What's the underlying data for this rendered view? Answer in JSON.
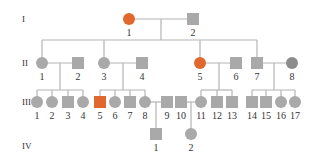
{
  "colors": {
    "affected": "#e0682e",
    "unaffected": "#a9a9a9",
    "dark": "#8c8c8c",
    "line": "#b4b4b4"
  },
  "generations": [
    {
      "label": "I",
      "y": 19
    },
    {
      "label": "II",
      "y": 63
    },
    {
      "label": "III",
      "y": 102
    },
    {
      "label": "IV",
      "y": 146
    }
  ],
  "individuals": [
    {
      "id": "I-1",
      "gen": "I",
      "num": "1",
      "sex": "female",
      "status": "affected",
      "x": 129,
      "y": 19
    },
    {
      "id": "I-2",
      "gen": "I",
      "num": "2",
      "sex": "male",
      "status": "unaffected",
      "x": 193,
      "y": 19
    },
    {
      "id": "II-1",
      "gen": "II",
      "num": "1",
      "sex": "female",
      "status": "unaffected",
      "x": 42,
      "y": 63
    },
    {
      "id": "II-2",
      "gen": "II",
      "num": "2",
      "sex": "male",
      "status": "unaffected",
      "x": 78,
      "y": 63
    },
    {
      "id": "II-3",
      "gen": "II",
      "num": "3",
      "sex": "female",
      "status": "unaffected",
      "x": 104,
      "y": 63
    },
    {
      "id": "II-4",
      "gen": "II",
      "num": "4",
      "sex": "male",
      "status": "unaffected",
      "x": 142,
      "y": 63
    },
    {
      "id": "II-5",
      "gen": "II",
      "num": "5",
      "sex": "female",
      "status": "affected",
      "x": 200,
      "y": 63
    },
    {
      "id": "II-6",
      "gen": "II",
      "num": "6",
      "sex": "male",
      "status": "unaffected",
      "x": 236,
      "y": 63
    },
    {
      "id": "II-7",
      "gen": "II",
      "num": "7",
      "sex": "male",
      "status": "unaffected",
      "x": 257,
      "y": 63
    },
    {
      "id": "II-8",
      "gen": "II",
      "num": "8",
      "sex": "female",
      "status": "dark",
      "x": 292,
      "y": 63
    },
    {
      "id": "III-1",
      "gen": "III",
      "num": "1",
      "sex": "female",
      "status": "unaffected",
      "x": 37,
      "y": 102
    },
    {
      "id": "III-2",
      "gen": "III",
      "num": "2",
      "sex": "female",
      "status": "unaffected",
      "x": 52,
      "y": 102
    },
    {
      "id": "III-3",
      "gen": "III",
      "num": "3",
      "sex": "male",
      "status": "unaffected",
      "x": 68,
      "y": 102
    },
    {
      "id": "III-4",
      "gen": "III",
      "num": "4",
      "sex": "female",
      "status": "unaffected",
      "x": 83,
      "y": 102
    },
    {
      "id": "III-5",
      "gen": "III",
      "num": "5",
      "sex": "male",
      "status": "affected",
      "x": 100,
      "y": 102
    },
    {
      "id": "III-6",
      "gen": "III",
      "num": "6",
      "sex": "female",
      "status": "unaffected",
      "x": 115,
      "y": 102
    },
    {
      "id": "III-7",
      "gen": "III",
      "num": "7",
      "sex": "male",
      "status": "unaffected",
      "x": 130,
      "y": 102
    },
    {
      "id": "III-8",
      "gen": "III",
      "num": "8",
      "sex": "female",
      "status": "unaffected",
      "x": 145,
      "y": 102
    },
    {
      "id": "III-9",
      "gen": "III",
      "num": "9",
      "sex": "male",
      "status": "unaffected",
      "x": 167,
      "y": 102
    },
    {
      "id": "III-10",
      "gen": "III",
      "num": "10",
      "sex": "male",
      "status": "unaffected",
      "x": 181,
      "y": 102
    },
    {
      "id": "III-11",
      "gen": "III",
      "num": "11",
      "sex": "female",
      "status": "unaffected",
      "x": 201,
      "y": 102
    },
    {
      "id": "III-12",
      "gen": "III",
      "num": "12",
      "sex": "male",
      "status": "unaffected",
      "x": 217,
      "y": 102
    },
    {
      "id": "III-13",
      "gen": "III",
      "num": "13",
      "sex": "male",
      "status": "unaffected",
      "x": 232,
      "y": 102
    },
    {
      "id": "III-14",
      "gen": "III",
      "num": "14",
      "sex": "male",
      "status": "unaffected",
      "x": 252,
      "y": 102
    },
    {
      "id": "III-15",
      "gen": "III",
      "num": "15",
      "sex": "male",
      "status": "unaffected",
      "x": 266,
      "y": 102
    },
    {
      "id": "III-16",
      "gen": "III",
      "num": "16",
      "sex": "female",
      "status": "unaffected",
      "x": 281,
      "y": 102
    },
    {
      "id": "III-17",
      "gen": "III",
      "num": "17",
      "sex": "female",
      "status": "unaffected",
      "x": 295,
      "y": 102
    },
    {
      "id": "IV-1",
      "gen": "IV",
      "num": "1",
      "sex": "male",
      "status": "unaffected",
      "x": 156,
      "y": 134
    },
    {
      "id": "IV-2",
      "gen": "IV",
      "num": "2",
      "sex": "female",
      "status": "unaffected",
      "x": 191,
      "y": 134
    }
  ],
  "lines": [
    [
      129,
      19,
      193,
      19
    ],
    [
      161,
      19,
      161,
      40
    ],
    [
      42,
      40,
      257,
      40
    ],
    [
      42,
      40,
      42,
      63
    ],
    [
      104,
      40,
      104,
      63
    ],
    [
      200,
      40,
      200,
      63
    ],
    [
      257,
      40,
      257,
      63
    ],
    [
      42,
      63,
      78,
      63
    ],
    [
      104,
      63,
      142,
      63
    ],
    [
      200,
      63,
      236,
      63
    ],
    [
      257,
      63,
      292,
      63
    ],
    [
      60,
      63,
      60,
      90
    ],
    [
      37,
      90,
      83,
      90
    ],
    [
      37,
      90,
      37,
      102
    ],
    [
      52,
      90,
      52,
      102
    ],
    [
      68,
      90,
      68,
      102
    ],
    [
      83,
      90,
      83,
      102
    ],
    [
      123,
      63,
      123,
      90
    ],
    [
      100,
      90,
      145,
      90
    ],
    [
      100,
      90,
      100,
      102
    ],
    [
      115,
      90,
      115,
      102
    ],
    [
      130,
      90,
      130,
      102
    ],
    [
      145,
      90,
      145,
      102
    ],
    [
      219,
      63,
      219,
      90
    ],
    [
      201,
      90,
      232,
      90
    ],
    [
      201,
      90,
      201,
      102
    ],
    [
      217,
      90,
      217,
      102
    ],
    [
      232,
      90,
      232,
      102
    ],
    [
      274,
      63,
      274,
      90
    ],
    [
      252,
      90,
      295,
      90
    ],
    [
      252,
      90,
      252,
      102
    ],
    [
      266,
      90,
      266,
      102
    ],
    [
      281,
      90,
      281,
      102
    ],
    [
      295,
      90,
      295,
      102
    ],
    [
      145,
      102,
      167,
      102
    ],
    [
      156,
      102,
      156,
      134
    ],
    [
      181,
      102,
      201,
      102
    ],
    [
      191,
      102,
      191,
      134
    ]
  ]
}
